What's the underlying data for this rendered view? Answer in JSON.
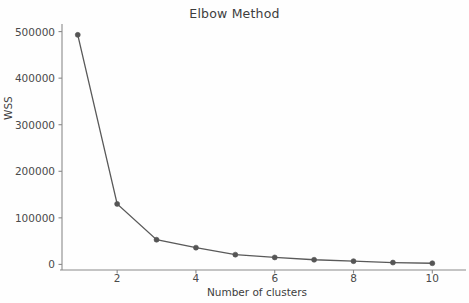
{
  "chart_data": {
    "type": "line",
    "title": "Elbow Method",
    "xlabel": "Number of clusters",
    "ylabel": "WSS",
    "x": [
      1,
      2,
      3,
      4,
      5,
      6,
      7,
      8,
      9,
      10
    ],
    "values": [
      493000,
      130000,
      53000,
      36000,
      21000,
      15000,
      10000,
      7000,
      4000,
      2500
    ],
    "series": [
      {
        "name": "WSS",
        "values": [
          493000,
          130000,
          53000,
          36000,
          21000,
          15000,
          10000,
          7000,
          4000,
          2500
        ]
      }
    ],
    "xlim": [
      0.6,
      10.5
    ],
    "ylim": [
      -12000,
      512000
    ],
    "xticks": [
      2,
      4,
      6,
      8,
      10
    ],
    "xtick_labels": [
      "2",
      "4",
      "6",
      "8",
      "10"
    ],
    "yticks": [
      0,
      100000,
      200000,
      300000,
      400000,
      500000
    ],
    "ytick_labels": [
      "0",
      "100000",
      "200000",
      "300000",
      "400000",
      "500000"
    ],
    "grid": false,
    "legend": false,
    "marker": "circle",
    "line_color": "#595959",
    "marker_color": "#555555",
    "background_color": "#fefefe",
    "axis_color": "#8a8a8a",
    "text_color": "#3d3d3d"
  }
}
